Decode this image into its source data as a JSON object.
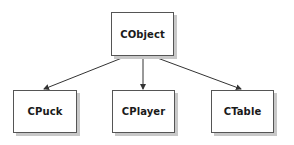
{
  "diagram": {
    "type": "class-hierarchy",
    "root": {
      "id": "cobject",
      "label": "CObject"
    },
    "children": [
      {
        "id": "cpuck",
        "label": "CPuck"
      },
      {
        "id": "cplayer",
        "label": "CPlayer"
      },
      {
        "id": "ctable",
        "label": "CTable"
      }
    ],
    "edges": [
      {
        "from": "CObject",
        "to": "CPuck"
      },
      {
        "from": "CObject",
        "to": "CPlayer"
      },
      {
        "from": "CObject",
        "to": "CTable"
      }
    ],
    "colors": {
      "border": "#555555",
      "shadow": "#c8c8c8",
      "text": "#1a1a1a",
      "edge": "#333333",
      "background": "#ffffff"
    }
  }
}
